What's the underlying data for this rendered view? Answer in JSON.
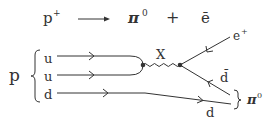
{
  "equation": {
    "lhs": "p",
    "lhs_sup": "+",
    "arrow": "⟶",
    "product1": "π",
    "product1_sup": "0",
    "plus": "+",
    "product2": "ē"
  },
  "diagram": {
    "proton_label": "p",
    "quarks": [
      "u",
      "u",
      "d"
    ],
    "boson_label": "X",
    "positron_label": "e",
    "positron_sup": "+",
    "antiquark_label": "d̄",
    "outgoing_quark_label": "d",
    "meson_label": "π",
    "meson_sup": "0"
  },
  "colors": {
    "ink": "#333333",
    "background": "#ffffff"
  }
}
